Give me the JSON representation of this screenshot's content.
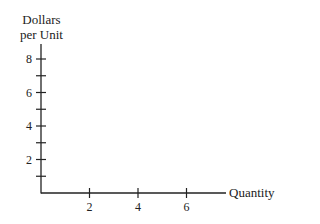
{
  "chart_data": {
    "type": "line",
    "title": "",
    "xlabel": "Quantity",
    "ylabel": "Dollars per Unit",
    "ylabel_lines": [
      "Dollars",
      "per Unit"
    ],
    "x_ticks": [
      2,
      4,
      6
    ],
    "x_tick_labels": [
      "2",
      "4",
      "6"
    ],
    "y_ticks": [
      1,
      2,
      3,
      4,
      5,
      6,
      7,
      8
    ],
    "y_tick_labels": [
      "2",
      "4",
      "6",
      "8"
    ],
    "xlim": [
      0,
      7.7
    ],
    "ylim": [
      0,
      8.6
    ],
    "grid": false,
    "series": []
  }
}
